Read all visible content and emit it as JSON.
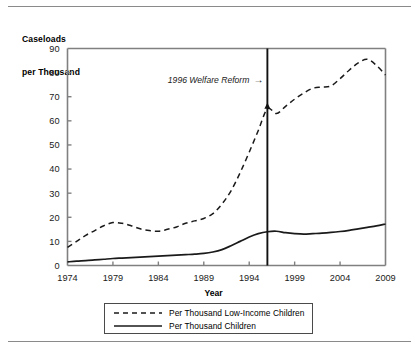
{
  "figure": {
    "y_axis_title_line1": "Caseloads",
    "y_axis_title_line2": "per Thousand",
    "x_axis_title": "Year",
    "annotation": "1996 Welfare Reform",
    "annotation_arrow": "→",
    "colors": {
      "line": "#1a1a1a",
      "axis": "#808080",
      "rule": "#8a8a8a",
      "background": "#ffffff"
    }
  },
  "chart_data": {
    "type": "line",
    "title": "",
    "xlabel": "Year",
    "ylabel": "Caseloads per Thousand",
    "xlim": [
      1974,
      2009
    ],
    "ylim": [
      0,
      90
    ],
    "ytick_labels": [
      "0",
      "10",
      "20",
      "30",
      "40",
      "50",
      "60",
      "70",
      "80",
      "90"
    ],
    "yticks": [
      0,
      10,
      20,
      30,
      40,
      50,
      60,
      70,
      80,
      90
    ],
    "xtick_labels": [
      "1974",
      "1979",
      "1984",
      "1989",
      "1994",
      "1999",
      "2004",
      "2009"
    ],
    "xticks": [
      1974,
      1979,
      1984,
      1989,
      1994,
      1999,
      2004,
      2009
    ],
    "grid": false,
    "legend_position": "below",
    "annotations": [
      {
        "text": "1996 Welfare Reform",
        "arrow": "→",
        "x": 1996,
        "y": 77,
        "style": "italic",
        "vline_x": 1996
      }
    ],
    "x": [
      1974,
      1975,
      1976,
      1977,
      1978,
      1979,
      1980,
      1981,
      1982,
      1983,
      1984,
      1985,
      1986,
      1987,
      1988,
      1989,
      1990,
      1991,
      1992,
      1993,
      1994,
      1995,
      1996,
      1997,
      1998,
      1999,
      2000,
      2001,
      2002,
      2003,
      2004,
      2005,
      2006,
      2007,
      2008,
      2009
    ],
    "series": [
      {
        "name": "Per Thousand Low-Income Children",
        "style": "dashed",
        "values": [
          7.5,
          10.0,
          12.5,
          14.5,
          16.5,
          17.8,
          17.5,
          16.5,
          15.2,
          14.5,
          14.2,
          15.0,
          16.0,
          17.5,
          18.5,
          19.5,
          21.5,
          25.5,
          31.0,
          38.5,
          47.0,
          56.0,
          65.0,
          63.0,
          66.0,
          69.0,
          71.5,
          73.5,
          74.0,
          74.5,
          77.5,
          81.0,
          84.0,
          85.5,
          83.0,
          79.0
        ]
      },
      {
        "name": "Per Thousand Children",
        "style": "solid",
        "values": [
          1.5,
          1.8,
          2.0,
          2.3,
          2.6,
          2.9,
          3.1,
          3.3,
          3.5,
          3.7,
          3.9,
          4.1,
          4.3,
          4.5,
          4.7,
          5.0,
          5.6,
          6.6,
          8.2,
          10.0,
          11.8,
          13.2,
          14.0,
          14.2,
          13.6,
          13.2,
          13.0,
          13.2,
          13.4,
          13.7,
          14.1,
          14.6,
          15.2,
          15.8,
          16.4,
          17.2
        ]
      }
    ]
  },
  "legend": {
    "items": [
      {
        "label": "Per Thousand Low-Income Children",
        "style": "dashed"
      },
      {
        "label": "Per Thousand Children",
        "style": "solid"
      }
    ]
  }
}
